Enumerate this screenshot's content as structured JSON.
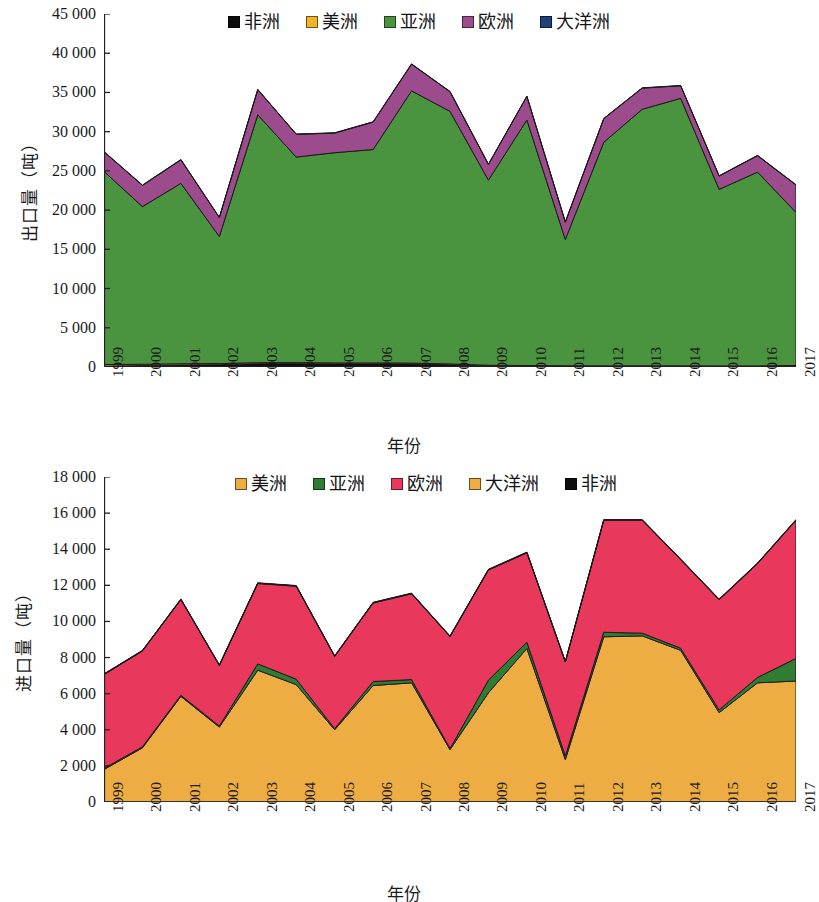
{
  "chart_data": [
    {
      "type": "area",
      "stacked": true,
      "title": "",
      "xlabel": "年份",
      "ylabel": "出口量（吨）",
      "ylim": [
        0,
        45000
      ],
      "ytick_labels": [
        "0",
        "5 000",
        "10 000",
        "15 000",
        "20 000",
        "25 000",
        "30 000",
        "35 000",
        "40 000",
        "45 000"
      ],
      "ytick_values": [
        0,
        5000,
        10000,
        15000,
        20000,
        25000,
        30000,
        35000,
        40000,
        45000
      ],
      "grid": false,
      "legend_position": "top-center",
      "categories": [
        "1999",
        "2000",
        "2001",
        "2002",
        "2003",
        "2004",
        "2005",
        "2006",
        "2007",
        "2008",
        "2009",
        "2010",
        "2011",
        "2012",
        "2013",
        "2014",
        "2015",
        "2016",
        "2017"
      ],
      "series": [
        {
          "name": "非洲",
          "color": "#0d0d0d",
          "values": [
            120,
            180,
            260,
            300,
            420,
            430,
            400,
            400,
            380,
            280,
            120,
            90,
            70,
            60,
            60,
            60,
            50,
            50,
            90
          ]
        },
        {
          "name": "美洲",
          "color": "#f0b429",
          "values": [
            210,
            170,
            150,
            140,
            130,
            130,
            120,
            120,
            120,
            110,
            100,
            100,
            90,
            90,
            90,
            90,
            90,
            90,
            110
          ]
        },
        {
          "name": "亚洲",
          "color": "#4a9440",
          "values": [
            24600,
            20100,
            23000,
            16200,
            31600,
            26200,
            26800,
            27200,
            34700,
            32200,
            23600,
            31300,
            16100,
            28500,
            32700,
            34100,
            22500,
            24700,
            19500
          ]
        },
        {
          "name": "欧洲",
          "color": "#9c4c8c",
          "values": [
            2500,
            2700,
            3000,
            2400,
            3200,
            2900,
            2500,
            3500,
            3400,
            2500,
            2000,
            3000,
            2200,
            3000,
            2700,
            1600,
            1700,
            2100,
            3500
          ]
        },
        {
          "name": "大洋洲",
          "color": "#20417a",
          "values": [
            40,
            40,
            40,
            40,
            40,
            40,
            40,
            40,
            40,
            40,
            40,
            40,
            40,
            40,
            40,
            40,
            40,
            40,
            40
          ]
        }
      ],
      "totals": [
        27470,
        23190,
        26450,
        19080,
        35390,
        29700,
        29860,
        31260,
        38640,
        35130,
        25860,
        34530,
        18500,
        31690,
        35590,
        35890,
        24380,
        26980,
        23240
      ]
    },
    {
      "type": "area",
      "stacked": true,
      "title": "",
      "xlabel": "年份",
      "ylabel": "进口量（吨）",
      "ylim": [
        0,
        18000
      ],
      "ytick_labels": [
        "0",
        "2 000",
        "4 000",
        "6 000",
        "8 000",
        "10 000",
        "12 000",
        "14 000",
        "16 000",
        "18 000"
      ],
      "ytick_values": [
        0,
        2000,
        4000,
        6000,
        8000,
        10000,
        12000,
        14000,
        16000,
        18000
      ],
      "grid": false,
      "legend_position": "top-center",
      "categories": [
        "1999",
        "2000",
        "2001",
        "2002",
        "2003",
        "2004",
        "2005",
        "2006",
        "2007",
        "2008",
        "2009",
        "2010",
        "2011",
        "2012",
        "2013",
        "2014",
        "2015",
        "2016",
        "2017"
      ],
      "series": [
        {
          "name": "美洲",
          "color": "#eead42",
          "values": [
            1800,
            3000,
            5850,
            4150,
            7300,
            6500,
            4000,
            6450,
            6600,
            2900,
            6050,
            8500,
            2350,
            9150,
            9200,
            8400,
            4950,
            6600,
            6700
          ]
        },
        {
          "name": "亚洲",
          "color": "#2f7d32",
          "values": [
            60,
            60,
            60,
            60,
            350,
            300,
            60,
            220,
            180,
            60,
            700,
            350,
            200,
            250,
            150,
            120,
            150,
            300,
            1250
          ]
        },
        {
          "name": "欧洲",
          "color": "#e8385c",
          "values": [
            5200,
            5300,
            5300,
            3350,
            4450,
            5150,
            4000,
            4350,
            4750,
            6200,
            6100,
            4950,
            5200,
            6200,
            6250,
            4900,
            6100,
            6300,
            7650
          ]
        },
        {
          "name": "大洋洲",
          "color": "#eead42",
          "values": [
            20,
            20,
            20,
            20,
            20,
            20,
            20,
            20,
            20,
            20,
            20,
            20,
            20,
            20,
            20,
            20,
            20,
            20,
            20
          ]
        },
        {
          "name": "非洲",
          "color": "#0d0d0d",
          "values": [
            20,
            20,
            20,
            20,
            20,
            20,
            20,
            20,
            20,
            20,
            20,
            20,
            20,
            20,
            20,
            20,
            20,
            20,
            20
          ]
        }
      ],
      "totals": [
        7100,
        8400,
        11250,
        7600,
        12140,
        11990,
        8100,
        11060,
        11570,
        9200,
        12890,
        13840,
        7790,
        15620,
        15640,
        13460,
        11240,
        13240,
        15640
      ]
    }
  ],
  "top_chart": {
    "ylabel": "出口量（吨）",
    "xlabel": "年份",
    "legend": [
      {
        "label": "非洲",
        "color": "#0d0d0d"
      },
      {
        "label": "美洲",
        "color": "#f0b429"
      },
      {
        "label": "亚洲",
        "color": "#4a9440"
      },
      {
        "label": "欧洲",
        "color": "#9c4c8c"
      },
      {
        "label": "大洋洲",
        "color": "#20417a"
      }
    ]
  },
  "bottom_chart": {
    "ylabel": "进口量（吨）",
    "xlabel": "年份",
    "legend": [
      {
        "label": "美洲",
        "color": "#eead42"
      },
      {
        "label": "亚洲",
        "color": "#2f7d32"
      },
      {
        "label": "欧洲",
        "color": "#e8385c"
      },
      {
        "label": "大洋洲",
        "color": "#eead42"
      },
      {
        "label": "非洲",
        "color": "#0d0d0d"
      }
    ]
  }
}
